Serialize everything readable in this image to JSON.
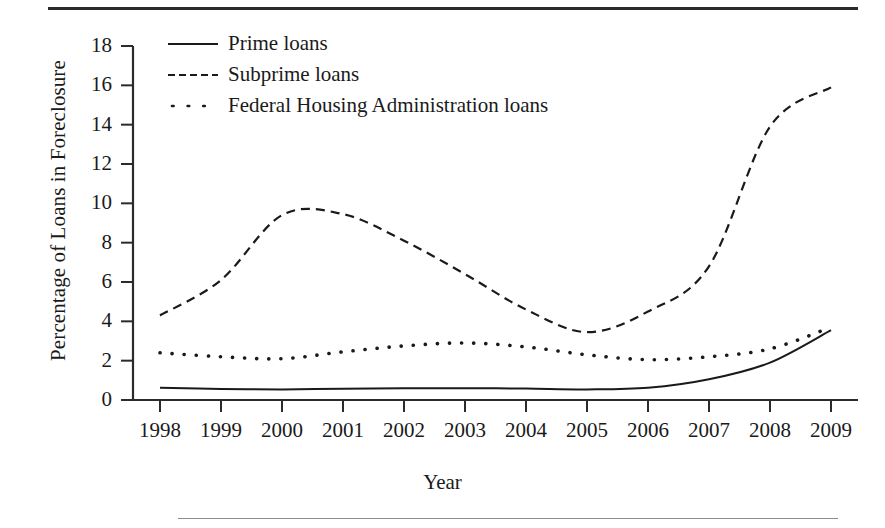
{
  "chart_data": {
    "type": "line",
    "title": "",
    "xlabel": "Year",
    "ylabel": "Percentage of Loans in Foreclosure",
    "x": [
      1998,
      1999,
      2000,
      2001,
      2002,
      2003,
      2004,
      2005,
      2006,
      2007,
      2008,
      2009
    ],
    "categories": [
      "1998",
      "1999",
      "2000",
      "2001",
      "2002",
      "2003",
      "2004",
      "2005",
      "2006",
      "2007",
      "2008",
      "2009"
    ],
    "xlim": [
      1998,
      2009
    ],
    "ylim": [
      0,
      18
    ],
    "yticks": [
      0,
      2,
      4,
      6,
      8,
      10,
      12,
      14,
      16,
      18
    ],
    "ytick_labels": [
      "0",
      "2",
      "4",
      "6",
      "8",
      "10",
      "12",
      "14",
      "16",
      "18"
    ],
    "grid": false,
    "legend_position": "top-left",
    "series": [
      {
        "name": "Prime loans",
        "style": "solid",
        "color": "#1a1a1a",
        "values": [
          0.62,
          0.56,
          0.54,
          0.57,
          0.6,
          0.6,
          0.58,
          0.54,
          0.62,
          1.05,
          1.9,
          3.55
        ]
      },
      {
        "name": "Subprime loans",
        "style": "dashed",
        "color": "#1a1a1a",
        "values": [
          4.3,
          6.1,
          9.4,
          9.45,
          8.1,
          6.4,
          4.6,
          3.45,
          4.5,
          6.8,
          13.9,
          15.9
        ]
      },
      {
        "name": "Federal Housing Administration loans",
        "style": "dotted",
        "color": "#1a1a1a",
        "values": [
          2.4,
          2.2,
          2.1,
          2.45,
          2.75,
          2.9,
          2.7,
          2.3,
          2.05,
          2.2,
          2.6,
          3.7
        ]
      }
    ]
  },
  "legend": {
    "items": [
      {
        "label": "Prime loans",
        "style": "solid"
      },
      {
        "label": "Subprime loans",
        "style": "dashed"
      },
      {
        "label": "Federal Housing Administration loans",
        "style": "dotted"
      }
    ]
  }
}
